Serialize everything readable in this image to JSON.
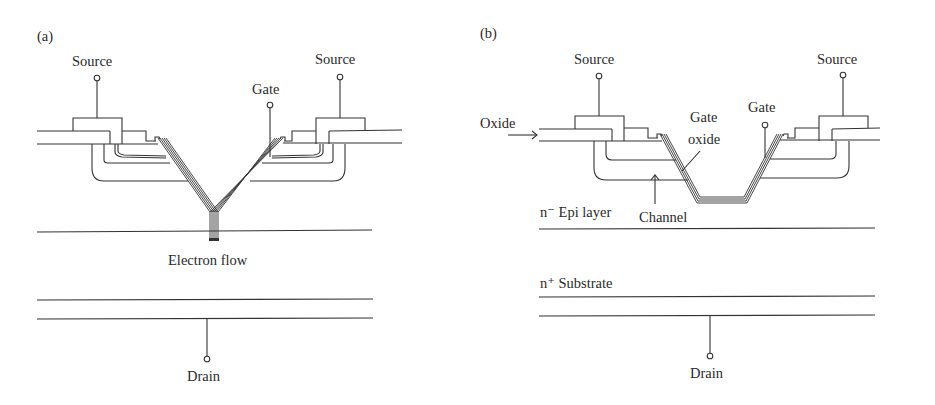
{
  "figure": {
    "colors": {
      "line": "#333333",
      "text": "#2a2a2a",
      "background": "#ffffff"
    }
  },
  "panel_a": {
    "tag": "(a)",
    "labels": {
      "source_left": "Source",
      "source_right": "Source",
      "gate": "Gate",
      "electron_flow": "Electron flow",
      "drain": "Drain"
    }
  },
  "panel_b": {
    "tag": "(b)",
    "labels": {
      "source_left": "Source",
      "source_right": "Source",
      "gate": "Gate",
      "oxide": "Oxide",
      "gate_oxide_line1": "Gate",
      "gate_oxide_line2": "oxide",
      "epi_layer": "n⁻ Epi layer",
      "channel": "Channel",
      "substrate": "n⁺ Substrate",
      "drain": "Drain"
    }
  }
}
